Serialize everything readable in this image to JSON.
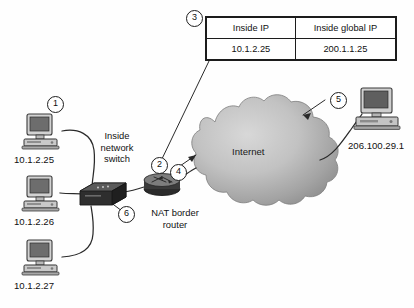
{
  "diagram": {
    "background": "#fefefe",
    "cloud": {
      "label": "Internet",
      "fill_light": "#cfcfcf",
      "fill_dark": "#8f8f8f"
    },
    "nat_table": {
      "headers": [
        "Inside IP",
        "Inside global IP"
      ],
      "rows": [
        [
          "10.1.2.25",
          "200.1.1.25"
        ]
      ]
    },
    "callouts": [
      {
        "id": "callout-1",
        "label": "1"
      },
      {
        "id": "callout-2",
        "label": "2"
      },
      {
        "id": "callout-3",
        "label": "3"
      },
      {
        "id": "callout-4",
        "label": "4"
      },
      {
        "id": "callout-5",
        "label": "5"
      },
      {
        "id": "callout-6",
        "label": "6"
      }
    ],
    "hosts": [
      {
        "name": "host-top",
        "ip": "10.1.2.25"
      },
      {
        "name": "host-middle",
        "ip": "10.1.2.26"
      },
      {
        "name": "host-bottom",
        "ip": "10.1.2.27"
      },
      {
        "name": "host-remote",
        "ip": "206.100.29.1"
      }
    ],
    "devices": [
      {
        "name": "switch",
        "label": "Inside network switch"
      },
      {
        "name": "router",
        "label": "NAT border router"
      }
    ]
  }
}
